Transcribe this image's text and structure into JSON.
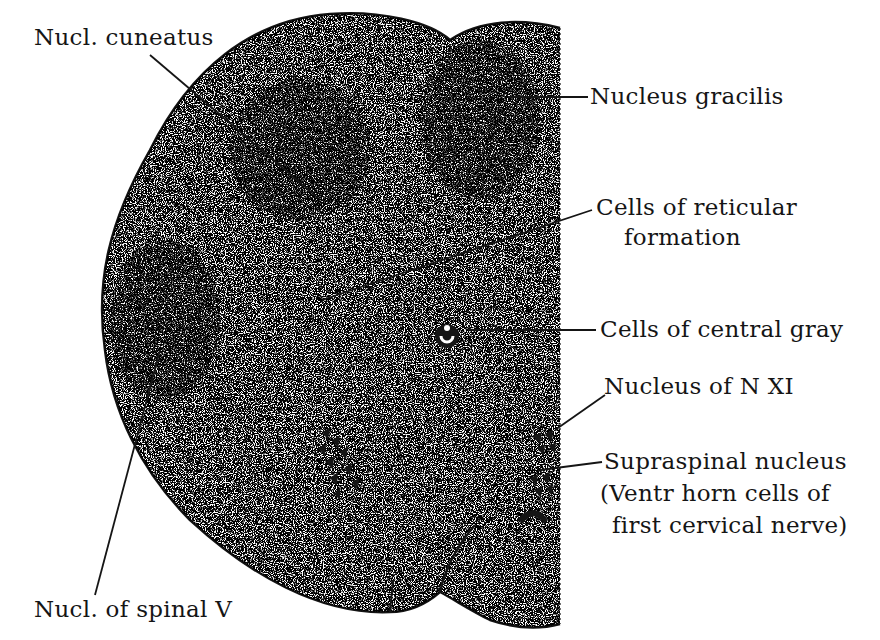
{
  "diagram": {
    "colors": {
      "ink": "#151515",
      "background": "#ffffff"
    },
    "labels": {
      "nucl_cuneatus": "Nucl. cuneatus",
      "nucleus_gracilis": "Nucleus gracilis",
      "reticular_line1": "Cells of reticular",
      "reticular_line2": "formation",
      "central_gray": "Cells of central gray",
      "nucleus_n_xi": "Nucleus of N XI",
      "supraspinal_line1": "Supraspinal nucleus",
      "supraspinal_line2": "(Ventr horn cells of",
      "supraspinal_line3": "first cervical nerve)",
      "spinal_v": "Nucl. of spinal V"
    }
  }
}
